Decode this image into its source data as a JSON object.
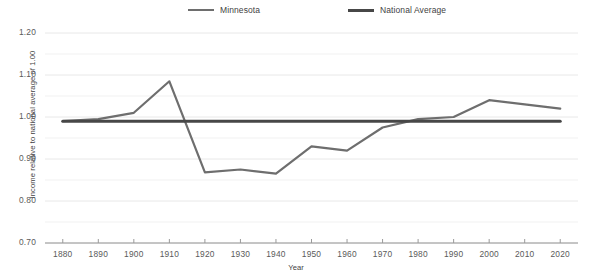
{
  "chart_data": {
    "type": "line",
    "title": "",
    "subtitle": "",
    "xlabel": "Year",
    "ylabel": "Income relative to national average of 1.00",
    "x": [
      1880,
      1890,
      1900,
      1910,
      1920,
      1930,
      1940,
      1950,
      1960,
      1970,
      1980,
      1990,
      2000,
      2010,
      2020
    ],
    "xlim": [
      1875,
      2025
    ],
    "ylim": [
      0.7,
      1.2
    ],
    "xticks": [
      1880,
      1890,
      1900,
      1910,
      1920,
      1930,
      1940,
      1950,
      1960,
      1970,
      1980,
      1990,
      2000,
      2010,
      2020
    ],
    "xtick_labels": [
      "1880",
      "1890",
      "1900",
      "1910",
      "1920",
      "1930",
      "1940",
      "1950",
      "1960",
      "1970",
      "1980",
      "1990",
      "2000",
      "2010",
      "2020"
    ],
    "yticks": [
      0.7,
      0.8,
      0.9,
      1.0,
      1.1,
      1.2
    ],
    "ytick_labels": [
      "0.70",
      "0.80",
      "0.90",
      "1.00",
      "1.10",
      "1.20"
    ],
    "minor_yticks": [
      0.75,
      0.85,
      0.95,
      1.05,
      1.15
    ],
    "grid": true,
    "grid_color": "#e8e8e8",
    "legend_position": "top-center",
    "series": [
      {
        "name": "Minnesota",
        "color": "#6e6e6e",
        "width": 2.2,
        "values": [
          0.99,
          0.995,
          1.01,
          1.085,
          0.868,
          0.875,
          0.865,
          0.93,
          0.92,
          0.975,
          0.995,
          1.0,
          1.04,
          1.03,
          1.02
        ]
      },
      {
        "name": "National Average",
        "color": "#474747",
        "width": 3.0,
        "constant": 0.99,
        "values": [
          0.99,
          0.99,
          0.99,
          0.99,
          0.99,
          0.99,
          0.99,
          0.99,
          0.99,
          0.99,
          0.99,
          0.99,
          0.99,
          0.99,
          0.99
        ]
      }
    ]
  },
  "legend": {
    "entries": [
      {
        "label": "Minnesota"
      },
      {
        "label": "National Average"
      }
    ]
  },
  "axes": {
    "x_title": "Year",
    "y_title": "Income relative to national average of 1.00"
  }
}
